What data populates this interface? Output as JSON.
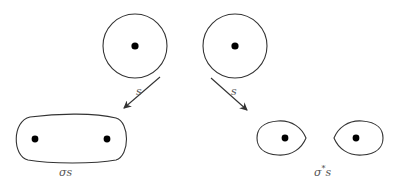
{
  "diagram": {
    "top_shapes": [
      {
        "name": "circle-left",
        "cx": 135,
        "cy": 46,
        "r": 32,
        "dot": [
          135,
          46
        ]
      },
      {
        "name": "circle-right",
        "cx": 235,
        "cy": 46,
        "r": 32,
        "dot": [
          235,
          46
        ]
      }
    ],
    "arrows": [
      {
        "label": "s",
        "from": [
          160,
          77
        ],
        "to": [
          124,
          108
        ],
        "label_pos": [
          139,
          93
        ]
      },
      {
        "label": "s",
        "from": [
          211,
          78
        ],
        "to": [
          247,
          110
        ],
        "label_pos": [
          232,
          93
        ]
      }
    ],
    "bottom_left": {
      "shape": "oval",
      "dots": [
        [
          35,
          139
        ],
        [
          107,
          139
        ]
      ],
      "caption": "σs"
    },
    "bottom_right": {
      "shape": "two-eggs",
      "dots": [
        [
          285,
          138
        ],
        [
          356,
          138
        ]
      ],
      "caption_base": "σ",
      "caption_sup": "*",
      "caption_tail": "s"
    },
    "colors": {
      "stroke": "#333333",
      "dot": "#000000",
      "label": "#555555"
    }
  }
}
